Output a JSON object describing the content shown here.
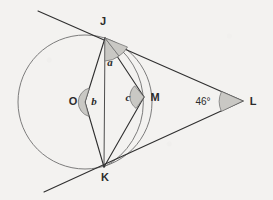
{
  "figure": {
    "type": "geometry-diagram",
    "background_color": "#f3f2f0",
    "stroke_color": "#2f2f2f",
    "circle_color": "#6e6e6e",
    "angle_fill_color": "#c9c8c4"
  },
  "points": [
    {
      "id": "J",
      "label": "J",
      "x": 105,
      "y": 38,
      "label_x": 103,
      "label_y": 25
    },
    {
      "id": "K",
      "label": "K",
      "x": 104,
      "y": 167,
      "label_x": 105,
      "label_y": 181
    },
    {
      "id": "O",
      "label": "O",
      "x": 85,
      "y": 102,
      "label_x": 73,
      "label_y": 105
    },
    {
      "id": "M",
      "label": "M",
      "x": 144,
      "y": 97,
      "label_x": 155,
      "label_y": 101
    },
    {
      "id": "L",
      "label": "L",
      "x": 243,
      "y": 101,
      "label_x": 253,
      "label_y": 105
    }
  ],
  "circles": [
    {
      "id": "circle-O",
      "center": "O",
      "cx": 85,
      "cy": 102,
      "r": 67
    },
    {
      "id": "circle-M",
      "center": "M",
      "cx": 144,
      "cy": 97,
      "r": 73
    }
  ],
  "angles": [
    {
      "id": "a",
      "label": "a",
      "at": "J",
      "label_x": 110,
      "label_y": 66,
      "shaded": true
    },
    {
      "id": "b",
      "label": "b",
      "at": "O",
      "label_x": 93,
      "label_y": 105,
      "shaded": true
    },
    {
      "id": "c",
      "label": "c",
      "at": "M",
      "label_x": 128,
      "label_y": 101,
      "shaded": true
    },
    {
      "id": "L",
      "label": "46°",
      "at": "L",
      "label_x": 203,
      "label_y": 105,
      "shaded": true
    }
  ],
  "segments": [
    {
      "id": "JO",
      "from": "J",
      "to": "O"
    },
    {
      "id": "OK",
      "from": "O",
      "to": "K"
    },
    {
      "id": "JK",
      "from": "J",
      "to": "K"
    },
    {
      "id": "JM",
      "from": "J",
      "to": "M"
    },
    {
      "id": "MK",
      "from": "M",
      "to": "K"
    },
    {
      "id": "JL",
      "from": "J",
      "to": "L"
    },
    {
      "id": "KL",
      "from": "K",
      "to": "L"
    }
  ],
  "tangent_lines": [
    {
      "id": "tangent-upper",
      "through": [
        "J",
        "L"
      ],
      "extends_to_x": 38,
      "extends_to_y": 11
    },
    {
      "id": "tangent-lower",
      "through": [
        "K",
        "L"
      ],
      "extends_to_x": 44,
      "extends_to_y": 192
    }
  ]
}
